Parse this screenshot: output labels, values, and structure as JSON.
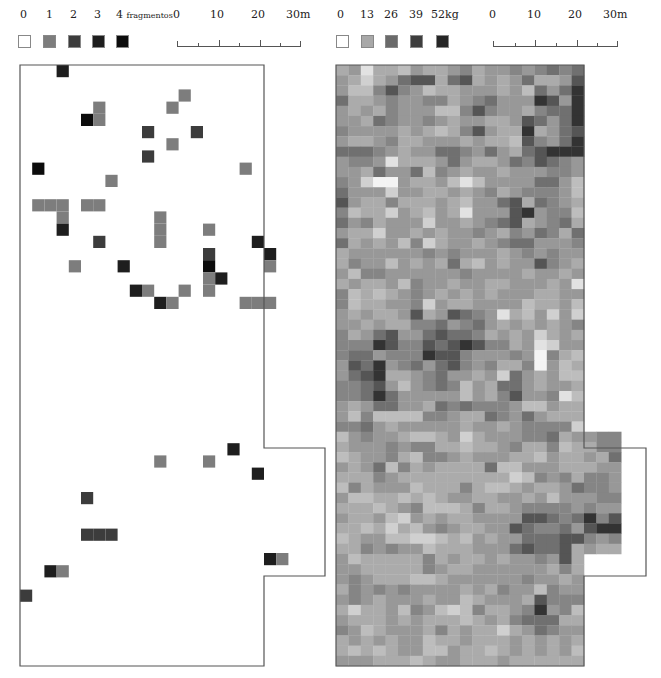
{
  "left_panel": {
    "legend": {
      "items": [
        {
          "label": "0",
          "color": "#ffffff"
        },
        {
          "label": "1",
          "color": "#7d7d7d"
        },
        {
          "label": "2",
          "color": "#3c3c3c"
        },
        {
          "label": "3",
          "color": "#1e1e1e"
        },
        {
          "label": "4",
          "color": "#0c0c0c"
        }
      ],
      "unit": "fragmentos"
    },
    "scale": {
      "ticks": [
        "0",
        "10",
        "20",
        "30m"
      ]
    },
    "map": {
      "cell_size": 12.2,
      "outline": "M0,0 H244 V383 H305 V511 H244 V601 H0 Z",
      "cells": [
        [
          3,
          0,
          3
        ],
        [
          13,
          2,
          1
        ],
        [
          6,
          3,
          1
        ],
        [
          12,
          3,
          1
        ],
        [
          5,
          4,
          4
        ],
        [
          6,
          4,
          1
        ],
        [
          10,
          5,
          2
        ],
        [
          14,
          5,
          2
        ],
        [
          12,
          6,
          1
        ],
        [
          10,
          7,
          2
        ],
        [
          1,
          8,
          4
        ],
        [
          18,
          8,
          1
        ],
        [
          7,
          9,
          1
        ],
        [
          1,
          11,
          1
        ],
        [
          2,
          11,
          1
        ],
        [
          3,
          11,
          1
        ],
        [
          5,
          11,
          1
        ],
        [
          6,
          11,
          1
        ],
        [
          3,
          12,
          1
        ],
        [
          11,
          12,
          1
        ],
        [
          3,
          13,
          3
        ],
        [
          11,
          13,
          1
        ],
        [
          15,
          13,
          1
        ],
        [
          6,
          14,
          2
        ],
        [
          11,
          14,
          1
        ],
        [
          19,
          14,
          3
        ],
        [
          15,
          15,
          2
        ],
        [
          20,
          15,
          3
        ],
        [
          4,
          16,
          1
        ],
        [
          8,
          16,
          3
        ],
        [
          15,
          16,
          4
        ],
        [
          20,
          16,
          1
        ],
        [
          15,
          17,
          1
        ],
        [
          16,
          17,
          3
        ],
        [
          9,
          18,
          3
        ],
        [
          10,
          18,
          1
        ],
        [
          13,
          18,
          1
        ],
        [
          15,
          18,
          1
        ],
        [
          11,
          19,
          3
        ],
        [
          12,
          19,
          1
        ],
        [
          18,
          19,
          1
        ],
        [
          19,
          19,
          1
        ],
        [
          20,
          19,
          1
        ],
        [
          17,
          31,
          3
        ],
        [
          11,
          32,
          1
        ],
        [
          15,
          32,
          1
        ],
        [
          19,
          33,
          3
        ],
        [
          5,
          35,
          2
        ],
        [
          5,
          38,
          2
        ],
        [
          6,
          38,
          2
        ],
        [
          7,
          38,
          2
        ],
        [
          20,
          40,
          3
        ],
        [
          21,
          40,
          1
        ],
        [
          2,
          41,
          3
        ],
        [
          3,
          41,
          1
        ],
        [
          0,
          43,
          2
        ]
      ]
    }
  },
  "right_panel": {
    "legend": {
      "items": [
        {
          "label": "0",
          "color": "#ffffff"
        },
        {
          "label": "13",
          "color": "#a8a8a8"
        },
        {
          "label": "26",
          "color": "#6a6a6a"
        },
        {
          "label": "39",
          "color": "#3e3e3e"
        },
        {
          "label": "52kg",
          "color": "#262626"
        }
      ]
    },
    "scale": {
      "ticks": [
        "0",
        "10",
        "20",
        "30m"
      ]
    },
    "map": {
      "cell_size": 12.4,
      "outline": "M0,0 H248 V383 H310 V511 H248 V601 H0 Z",
      "palette": [
        "#f4f4f4",
        "#e2e2e2",
        "#d0d0d0",
        "#bdbdbd",
        "#ababab",
        "#989898",
        "#858585",
        "#707070",
        "#555555",
        "#333333"
      ],
      "rows": [
        "45144354456455656767",
        "54245788478454574458",
        "53368653445554537579",
        "74456556645675559859",
        "54546555336865546779",
        "55476556545544587579",
        "65555454346854494578",
        "54456445554544386579",
        "77765455776575478999",
        "56651444575445768765",
        "55475573654554555665",
        "65200544531355557753",
        "75552554454564566653",
        "85446444543557847654",
        "63442543541555895663",
        "75645552554567845674",
        "54425545455654657647",
        "74545362455456775556",
        "45555556565554565655",
        "46553545474354558654",
        "53665555556555545545",
        "45445365545544555451",
        "63434565454545554455",
        "63445562544555534453",
        "54544584587651435252",
        "55454466756754545456",
        "64578557877645452454",
        "66698668789866451255",
        "67756669886555650643",
        "58795675786564460534",
        "57894456755452754533",
        "66785356763547754554",
        "66797555553546855613",
        "54577554767666533544",
        "53633336654476575444",
        "66754555554554566662",
        "35655433452455566745566",
        "45556566443445644634466",
        "34556436654555443544547",
        "54573645444473355544455",
        "44465444444444236564665",
        "36455534446433454457665",
        "53344343455445545355566",
        "44434563334644566665655",
        "54453254544555588767968",
        "44342435654455876675899",
        "34553322343545577788656",
        "44656553444555787784544",
        "53444446454454556584",
        "55444446544555555464",
        "56544433455555565545",
        "46565655554546553655",
        "56545554553455548666",
        "42445365323644569563",
        "54445454443454677744",
        "65345554645442457655",
        "45454553445444545454",
        "43434553354434545453",
        "55544434554445444444"
      ]
    }
  }
}
